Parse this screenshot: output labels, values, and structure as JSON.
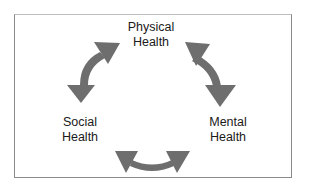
{
  "diagram": {
    "nodes": [
      {
        "id": "physical",
        "line1": "Physical",
        "line2": "Health"
      },
      {
        "id": "mental",
        "line1": "Mental",
        "line2": "Health"
      },
      {
        "id": "social",
        "line1": "Social",
        "line2": "Health"
      }
    ],
    "edges": [
      {
        "from": "physical",
        "to": "social",
        "type": "bidirectional"
      },
      {
        "from": "physical",
        "to": "mental",
        "type": "bidirectional"
      },
      {
        "from": "social",
        "to": "mental",
        "type": "bidirectional"
      }
    ],
    "arrow_color": "#6e6e6e",
    "border_color": "#8a8a8a"
  }
}
